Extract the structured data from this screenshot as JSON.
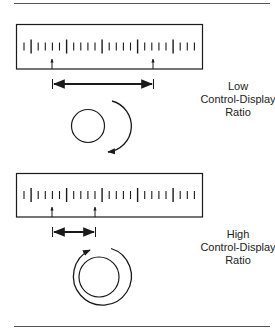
{
  "panels": [
    {
      "id": "low",
      "label_lines": [
        "Low",
        "Control-Display",
        "Ratio"
      ],
      "pointer_start_tick": 4,
      "pointer_end_tick": 18,
      "rotation": "partial clockwise arc",
      "knob_type": "small knob, short turn"
    },
    {
      "id": "high",
      "label_lines": [
        "High",
        "Control-Display",
        "Ratio"
      ],
      "pointer_start_tick": 4,
      "pointer_end_tick": 10,
      "rotation": "nearly full clockwise turn",
      "knob_type": "large knob, long turn"
    }
  ],
  "scale": {
    "tick_count": 25,
    "major_every": 5,
    "first_major_index": 1
  },
  "colors": {
    "stroke": "#1a1a1a",
    "rule": "#555555",
    "background": "#ffffff"
  }
}
